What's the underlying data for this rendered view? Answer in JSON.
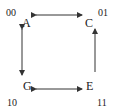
{
  "diagram": {
    "nodes": [
      {
        "id": "A",
        "label": "A",
        "code": "00"
      },
      {
        "id": "C",
        "label": "C",
        "code": "01"
      },
      {
        "id": "G",
        "label": "G",
        "code": "10"
      },
      {
        "id": "E",
        "label": "E",
        "code": "11"
      }
    ],
    "edges": [
      {
        "from": "A",
        "to": "C",
        "direction": "bidirectional"
      },
      {
        "from": "A",
        "to": "G",
        "direction": "bidirectional"
      },
      {
        "from": "G",
        "to": "E",
        "direction": "bidirectional"
      },
      {
        "from": "E",
        "to": "C",
        "direction": "forward"
      }
    ],
    "colors": {
      "stroke": "#333333",
      "text": "#222222"
    }
  }
}
